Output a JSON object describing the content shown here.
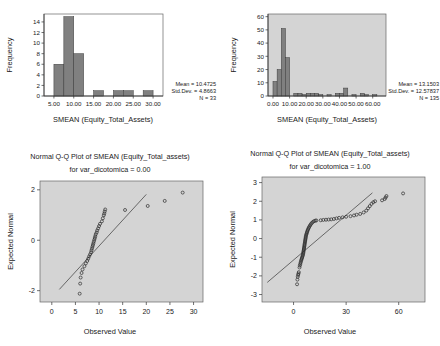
{
  "chart_data": [
    {
      "id": "histogram-0",
      "type": "bar",
      "title": "",
      "xlabel": "SMEAN (Equity_Total_Assets)",
      "ylabel": "Frequency",
      "xlim": [
        2.5,
        32.5
      ],
      "ylim": [
        0,
        15.5
      ],
      "xticks": [
        "5.00",
        "10.00",
        "15.00",
        "20.00",
        "25.00",
        "30.00"
      ],
      "xtickvals": [
        5,
        10,
        15,
        20,
        25,
        30
      ],
      "yticks": [
        "0",
        "2",
        "4",
        "6",
        "8",
        "10",
        "12",
        "14"
      ],
      "ytickvals": [
        0,
        2,
        4,
        6,
        8,
        10,
        12,
        14
      ],
      "bin_width": 2.5,
      "bins": [
        {
          "x0": 5.0,
          "x1": 7.5,
          "count": 6
        },
        {
          "x0": 7.5,
          "x1": 10.0,
          "count": 15
        },
        {
          "x0": 10.0,
          "x1": 12.5,
          "count": 8
        },
        {
          "x0": 15.0,
          "x1": 17.5,
          "count": 1
        },
        {
          "x0": 20.0,
          "x1": 22.5,
          "count": 1
        },
        {
          "x0": 22.5,
          "x1": 25.0,
          "count": 1
        },
        {
          "x0": 27.5,
          "x1": 30.0,
          "count": 1
        }
      ],
      "grid": false,
      "plot_background": "#ffffff",
      "annotations": {
        "mean": "Mean = 10.4725",
        "stddev": "Std.Dev. = 4.8663",
        "n": "N = 33"
      }
    },
    {
      "id": "histogram-1",
      "type": "bar",
      "title": "",
      "xlabel": "SMEAN (Equity_Total_Assets)",
      "ylabel": "Frequency",
      "xlim": [
        -3,
        68
      ],
      "ylim": [
        0,
        62
      ],
      "xticks": [
        "0.00",
        "10.00",
        "20.00",
        "30.00",
        "40.00",
        "50.00",
        "60.00"
      ],
      "xtickvals": [
        0,
        10,
        20,
        30,
        40,
        50,
        60
      ],
      "yticks": [
        "0",
        "10",
        "20",
        "30",
        "40",
        "50",
        "60"
      ],
      "ytickvals": [
        0,
        10,
        20,
        30,
        40,
        50,
        60
      ],
      "bin_width": 2.5,
      "bins": [
        {
          "x0": 0.0,
          "x1": 2.5,
          "count": 11
        },
        {
          "x0": 2.5,
          "x1": 5.0,
          "count": 20
        },
        {
          "x0": 5.0,
          "x1": 7.5,
          "count": 51
        },
        {
          "x0": 7.5,
          "x1": 10.0,
          "count": 29
        },
        {
          "x0": 12.5,
          "x1": 15.0,
          "count": 2
        },
        {
          "x0": 15.0,
          "x1": 17.5,
          "count": 2
        },
        {
          "x0": 17.5,
          "x1": 20.0,
          "count": 1
        },
        {
          "x0": 20.0,
          "x1": 22.5,
          "count": 2
        },
        {
          "x0": 22.5,
          "x1": 25.0,
          "count": 2
        },
        {
          "x0": 25.0,
          "x1": 27.5,
          "count": 2
        },
        {
          "x0": 27.5,
          "x1": 30.0,
          "count": 1
        },
        {
          "x0": 32.5,
          "x1": 35.0,
          "count": 1
        },
        {
          "x0": 37.5,
          "x1": 40.0,
          "count": 2
        },
        {
          "x0": 40.0,
          "x1": 42.5,
          "count": 2
        },
        {
          "x0": 42.5,
          "x1": 45.0,
          "count": 6
        },
        {
          "x0": 47.5,
          "x1": 50.0,
          "count": 1
        },
        {
          "x0": 52.5,
          "x1": 55.0,
          "count": 2
        },
        {
          "x0": 55.0,
          "x1": 57.5,
          "count": 1
        },
        {
          "x0": 60.0,
          "x1": 62.5,
          "count": 1
        }
      ],
      "grid": false,
      "plot_background": "#d4d4d4",
      "annotations": {
        "mean": "Mean = 13.1503",
        "stddev": "Std.Dev. = 12.57837",
        "n": "N = 135"
      }
    },
    {
      "id": "qqplot-0",
      "type": "scatter",
      "title": "Normal Q-Q Plot of SMEAN (Equity_Total_assets)",
      "subtitle": "for var_dicotomica = 0.00",
      "xlabel": "Observed Value",
      "ylabel": "Expected Normal",
      "xlim": [
        -2.5,
        32
      ],
      "ylim": [
        -2.45,
        2.35
      ],
      "xticks": [
        "0",
        "5",
        "10",
        "15",
        "20",
        "25",
        "30"
      ],
      "xtickvals": [
        0,
        5,
        10,
        15,
        20,
        25,
        30
      ],
      "yticks": [
        "-2",
        "0",
        "2"
      ],
      "ytickvals": [
        -2,
        0,
        2
      ],
      "grid": false,
      "plot_background": "#d4d4d4",
      "reference_line": {
        "x0": 1.6,
        "y0": -1.95,
        "x1": 20.0,
        "y1": 1.82
      },
      "points": [
        {
          "x": 5.9,
          "y": -2.12
        },
        {
          "x": 6.0,
          "y": -1.72
        },
        {
          "x": 6.1,
          "y": -1.48
        },
        {
          "x": 6.3,
          "y": -1.3
        },
        {
          "x": 6.5,
          "y": -1.16
        },
        {
          "x": 6.9,
          "y": -1.03
        },
        {
          "x": 7.2,
          "y": -0.92
        },
        {
          "x": 7.5,
          "y": -0.82
        },
        {
          "x": 7.7,
          "y": -0.73
        },
        {
          "x": 7.9,
          "y": -0.64
        },
        {
          "x": 8.1,
          "y": -0.56
        },
        {
          "x": 8.3,
          "y": -0.48
        },
        {
          "x": 8.4,
          "y": -0.4
        },
        {
          "x": 8.5,
          "y": -0.33
        },
        {
          "x": 8.6,
          "y": -0.26
        },
        {
          "x": 8.7,
          "y": -0.19
        },
        {
          "x": 8.8,
          "y": -0.12
        },
        {
          "x": 8.9,
          "y": -0.05
        },
        {
          "x": 9.0,
          "y": 0.02
        },
        {
          "x": 9.1,
          "y": 0.09
        },
        {
          "x": 9.2,
          "y": 0.16
        },
        {
          "x": 9.3,
          "y": 0.24
        },
        {
          "x": 9.5,
          "y": 0.31
        },
        {
          "x": 9.6,
          "y": 0.39
        },
        {
          "x": 9.8,
          "y": 0.47
        },
        {
          "x": 10.0,
          "y": 0.56
        },
        {
          "x": 10.2,
          "y": 0.65
        },
        {
          "x": 10.6,
          "y": 0.75
        },
        {
          "x": 10.8,
          "y": 0.87
        },
        {
          "x": 11.0,
          "y": 0.99
        },
        {
          "x": 11.1,
          "y": 1.06
        },
        {
          "x": 11.2,
          "y": 1.14
        },
        {
          "x": 11.3,
          "y": 1.22
        },
        {
          "x": 15.5,
          "y": 1.2
        },
        {
          "x": 20.3,
          "y": 1.36
        },
        {
          "x": 23.9,
          "y": 1.56
        },
        {
          "x": 27.7,
          "y": 1.89
        }
      ]
    },
    {
      "id": "qqplot-1",
      "type": "scatter",
      "title": "Normal Q-Q Plot of SMEAN (Equity_Total_assets)",
      "subtitle": "for var_dicotomica = 1.00",
      "xlabel": "Observed Value",
      "ylabel": "Expected Normal",
      "xlim": [
        -18,
        75
      ],
      "ylim": [
        -3.4,
        3.3
      ],
      "xticks": [
        "0",
        "30",
        "60"
      ],
      "xtickvals": [
        0,
        30,
        60
      ],
      "yticks": [
        "-3",
        "-2",
        "-1",
        "0",
        "1",
        "2",
        "3"
      ],
      "ytickvals": [
        -3,
        -2,
        -1,
        0,
        1,
        2,
        3
      ],
      "grid": false,
      "plot_background": "#d4d4d4",
      "reference_line": {
        "x0": -15.0,
        "y0": -2.35,
        "x1": 45.0,
        "y1": 2.45
      },
      "points": [
        {
          "x": 2.0,
          "y": -2.45
        },
        {
          "x": 2.2,
          "y": -2.2
        },
        {
          "x": 2.4,
          "y": -2.05
        },
        {
          "x": 2.6,
          "y": -1.95
        },
        {
          "x": 2.8,
          "y": -1.88
        },
        {
          "x": 3.0,
          "y": -1.8
        },
        {
          "x": 3.4,
          "y": -1.55
        },
        {
          "x": 3.6,
          "y": -1.45
        },
        {
          "x": 3.8,
          "y": -1.38
        },
        {
          "x": 4.0,
          "y": -1.3
        },
        {
          "x": 4.2,
          "y": -1.23
        },
        {
          "x": 4.4,
          "y": -1.16
        },
        {
          "x": 4.6,
          "y": -1.1
        },
        {
          "x": 4.8,
          "y": -1.04
        },
        {
          "x": 5.0,
          "y": -0.98
        },
        {
          "x": 5.2,
          "y": -0.92
        },
        {
          "x": 5.4,
          "y": -0.86
        },
        {
          "x": 5.5,
          "y": -0.8
        },
        {
          "x": 5.6,
          "y": -0.74
        },
        {
          "x": 5.7,
          "y": -0.68
        },
        {
          "x": 5.8,
          "y": -0.62
        },
        {
          "x": 5.9,
          "y": -0.56
        },
        {
          "x": 6.0,
          "y": -0.5
        },
        {
          "x": 6.1,
          "y": -0.44
        },
        {
          "x": 6.2,
          "y": -0.38
        },
        {
          "x": 6.3,
          "y": -0.32
        },
        {
          "x": 6.4,
          "y": -0.26
        },
        {
          "x": 6.5,
          "y": -0.2
        },
        {
          "x": 6.6,
          "y": -0.14
        },
        {
          "x": 6.7,
          "y": -0.08
        },
        {
          "x": 6.8,
          "y": -0.02
        },
        {
          "x": 6.9,
          "y": 0.04
        },
        {
          "x": 7.0,
          "y": 0.1
        },
        {
          "x": 7.1,
          "y": 0.16
        },
        {
          "x": 7.3,
          "y": 0.22
        },
        {
          "x": 7.5,
          "y": 0.28
        },
        {
          "x": 7.7,
          "y": 0.34
        },
        {
          "x": 7.9,
          "y": 0.4
        },
        {
          "x": 8.1,
          "y": 0.46
        },
        {
          "x": 8.4,
          "y": 0.52
        },
        {
          "x": 8.7,
          "y": 0.58
        },
        {
          "x": 9.0,
          "y": 0.64
        },
        {
          "x": 9.4,
          "y": 0.7
        },
        {
          "x": 9.8,
          "y": 0.76
        },
        {
          "x": 10.3,
          "y": 0.82
        },
        {
          "x": 10.9,
          "y": 0.88
        },
        {
          "x": 11.6,
          "y": 0.93
        },
        {
          "x": 12.4,
          "y": 0.96
        },
        {
          "x": 13.0,
          "y": 0.97
        },
        {
          "x": 15.5,
          "y": 0.98
        },
        {
          "x": 17.0,
          "y": 1.0
        },
        {
          "x": 18.5,
          "y": 1.01
        },
        {
          "x": 20.0,
          "y": 1.02
        },
        {
          "x": 21.5,
          "y": 1.03
        },
        {
          "x": 23.0,
          "y": 1.05
        },
        {
          "x": 24.5,
          "y": 1.08
        },
        {
          "x": 26.0,
          "y": 1.11
        },
        {
          "x": 28.0,
          "y": 1.14
        },
        {
          "x": 30.0,
          "y": 1.17
        },
        {
          "x": 32.5,
          "y": 1.2
        },
        {
          "x": 34.5,
          "y": 1.24
        },
        {
          "x": 36.0,
          "y": 1.28
        },
        {
          "x": 38.0,
          "y": 1.32
        },
        {
          "x": 40.0,
          "y": 1.4
        },
        {
          "x": 41.5,
          "y": 1.5
        },
        {
          "x": 42.5,
          "y": 1.62
        },
        {
          "x": 43.5,
          "y": 1.74
        },
        {
          "x": 44.5,
          "y": 1.86
        },
        {
          "x": 45.5,
          "y": 1.95
        },
        {
          "x": 46.5,
          "y": 2.0
        },
        {
          "x": 50.5,
          "y": 2.05
        },
        {
          "x": 52.0,
          "y": 2.12
        },
        {
          "x": 52.5,
          "y": 2.2
        },
        {
          "x": 53.0,
          "y": 2.28
        },
        {
          "x": 62.5,
          "y": 2.42
        }
      ]
    }
  ]
}
